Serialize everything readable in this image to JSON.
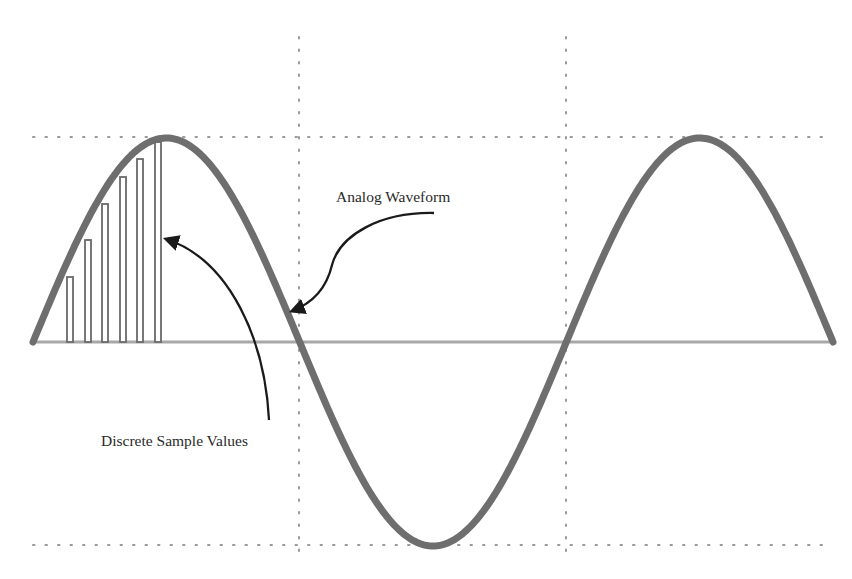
{
  "labels": {
    "analog": "Analog Waveform",
    "samples": "Discrete Sample Values"
  },
  "colors": {
    "background": "#ffffff",
    "waveform": "#6e6e6e",
    "axis": "#a8a8a8",
    "grid_dots": "#9a9a9a",
    "sample_bars": "#6a6a6a",
    "arrows": "#1a1a1a",
    "text": "#2a2a2a"
  },
  "geometry": {
    "x_start": 33,
    "x_end": 833,
    "baseline_y": 342,
    "amplitude": 204,
    "cycles": 1.5,
    "grid_h_lines_y": [
      137,
      545
    ],
    "grid_v_lines_x": [
      299,
      566
    ],
    "grid_v_top": 37,
    "grid_v_bottom": 553
  },
  "sample_bars": [
    {
      "x": 67,
      "top": 277
    },
    {
      "x": 85,
      "top": 240
    },
    {
      "x": 102,
      "top": 204
    },
    {
      "x": 120,
      "top": 177
    },
    {
      "x": 137,
      "top": 159
    },
    {
      "x": 155,
      "top": 142
    }
  ]
}
